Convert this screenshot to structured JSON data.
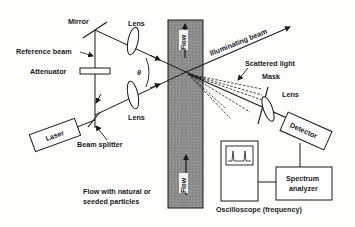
{
  "diagram": {
    "type": "laser-doppler-velocimetry-schematic",
    "labels": {
      "mirror": "Mirror",
      "lens_top": "Lens",
      "lens_bottom": "Lens",
      "lens_detector": "Lens",
      "reference_beam": "Reference beam",
      "attenuator": "Attenuator",
      "theta": "θ",
      "illuminating_beam": "Illuminating beam",
      "scattered_light": "Scattered light",
      "mask": "Mask",
      "laser": "Laser",
      "beam_splitter": "Beam splitter",
      "flow_top": "Flow",
      "flow_bottom": "Flow",
      "flow_caption_line1": "Flow with natural or",
      "flow_caption_line2": "seeded particles",
      "detector": "Detector",
      "spectrum_analyzer_line1": "Spectrum",
      "spectrum_analyzer_line2": "analyzer",
      "oscilloscope": "Oscilloscope (frequency)"
    },
    "colors": {
      "line": "#1a1a1a",
      "flow_channel": "#8a8a8a",
      "flow_label_bg": "#f2f2f2",
      "background": "#fdfdfb"
    }
  }
}
